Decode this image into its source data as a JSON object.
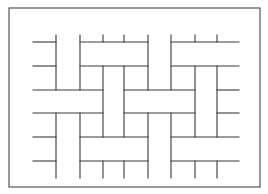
{
  "figure": {
    "frame": {
      "x": 9,
      "y": 8,
      "width": 251,
      "height": 179
    },
    "stroke_color": "#3a3a3a",
    "frame_color": "#555555",
    "horizontal_lines": [
      {
        "y": 42,
        "x1": 33,
        "x2": 56
      },
      {
        "y": 42,
        "x1": 80,
        "x2": 148
      },
      {
        "y": 42,
        "x1": 171,
        "x2": 239
      },
      {
        "y": 66,
        "x1": 33,
        "x2": 56
      },
      {
        "y": 66,
        "x1": 80,
        "x2": 148
      },
      {
        "y": 66,
        "x1": 171,
        "x2": 239
      },
      {
        "y": 90,
        "x1": 33,
        "x2": 103
      },
      {
        "y": 90,
        "x1": 124,
        "x2": 195
      },
      {
        "y": 90,
        "x1": 217,
        "x2": 239
      },
      {
        "y": 113,
        "x1": 33,
        "x2": 103
      },
      {
        "y": 113,
        "x1": 124,
        "x2": 195
      },
      {
        "y": 113,
        "x1": 217,
        "x2": 239
      },
      {
        "y": 137,
        "x1": 33,
        "x2": 56
      },
      {
        "y": 137,
        "x1": 80,
        "x2": 148
      },
      {
        "y": 137,
        "x1": 171,
        "x2": 239
      },
      {
        "y": 161,
        "x1": 33,
        "x2": 56
      },
      {
        "y": 161,
        "x1": 80,
        "x2": 148
      },
      {
        "y": 161,
        "x1": 171,
        "x2": 239
      }
    ],
    "vertical_lines": [
      {
        "x": 56,
        "y1": 35,
        "y2": 90
      },
      {
        "x": 56,
        "y1": 113,
        "y2": 178
      },
      {
        "x": 80,
        "y1": 35,
        "y2": 90
      },
      {
        "x": 80,
        "y1": 113,
        "y2": 178
      },
      {
        "x": 103,
        "y1": 35,
        "y2": 42
      },
      {
        "x": 103,
        "y1": 66,
        "y2": 137
      },
      {
        "x": 103,
        "y1": 161,
        "y2": 178
      },
      {
        "x": 124,
        "y1": 35,
        "y2": 42
      },
      {
        "x": 124,
        "y1": 66,
        "y2": 137
      },
      {
        "x": 124,
        "y1": 161,
        "y2": 178
      },
      {
        "x": 148,
        "y1": 35,
        "y2": 90
      },
      {
        "x": 148,
        "y1": 113,
        "y2": 178
      },
      {
        "x": 171,
        "y1": 35,
        "y2": 90
      },
      {
        "x": 171,
        "y1": 113,
        "y2": 178
      },
      {
        "x": 195,
        "y1": 35,
        "y2": 42
      },
      {
        "x": 195,
        "y1": 66,
        "y2": 137
      },
      {
        "x": 195,
        "y1": 161,
        "y2": 178
      },
      {
        "x": 217,
        "y1": 35,
        "y2": 42
      },
      {
        "x": 217,
        "y1": 66,
        "y2": 137
      },
      {
        "x": 217,
        "y1": 161,
        "y2": 178
      }
    ]
  }
}
